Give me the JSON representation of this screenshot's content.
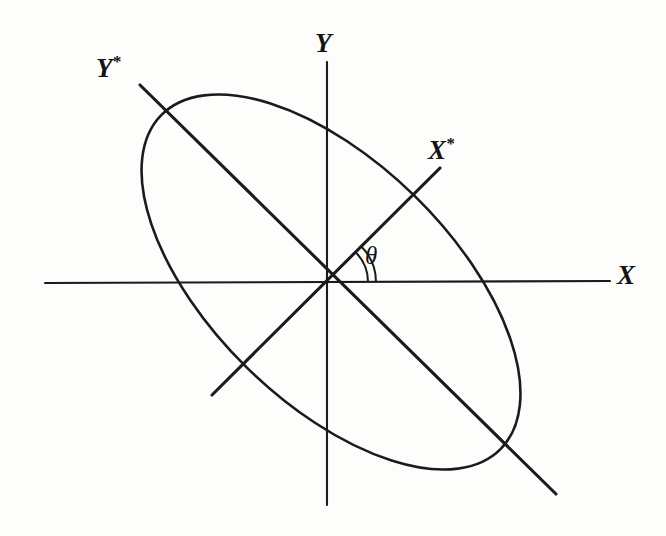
{
  "figure": {
    "background_color": "#fdfdfc",
    "ink_color": "#1b1b1b",
    "width": 666,
    "height": 536
  },
  "labels": {
    "x_axis": "X",
    "y_axis": "Y",
    "x_star_axis": "X",
    "x_star_superscript": "*",
    "y_star_axis": "Y",
    "y_star_superscript": "*",
    "angle": "θ"
  },
  "chart_data": {
    "type": "diagram",
    "origin": {
      "x": 326,
      "y": 282
    },
    "axes": [
      {
        "name": "X",
        "label": "X",
        "kind": "primary-horizontal",
        "from": {
          "x": 45,
          "y": 283
        },
        "to": {
          "x": 610,
          "y": 281
        },
        "angle_deg": 0,
        "label_position": {
          "x": 625,
          "y": 277
        }
      },
      {
        "name": "Y",
        "label": "Y",
        "kind": "primary-vertical",
        "from": {
          "x": 327,
          "y": 62
        },
        "to": {
          "x": 327,
          "y": 505
        },
        "angle_deg": 90,
        "label_position": {
          "x": 325,
          "y": 48
        }
      },
      {
        "name": "X*",
        "label": "X*",
        "kind": "rotated",
        "from": {
          "x": 212,
          "y": 395
        },
        "to": {
          "x": 440,
          "y": 168
        },
        "angle_deg": 44.8,
        "label_position": {
          "x": 445,
          "y": 152
        }
      },
      {
        "name": "Y*",
        "label": "Y*",
        "kind": "rotated",
        "from": {
          "x": 140,
          "y": 85
        },
        "to": {
          "x": 556,
          "y": 494
        },
        "angle_deg": -44.5,
        "label_position": {
          "x": 112,
          "y": 72
        }
      }
    ],
    "angle_marker": {
      "label": "θ",
      "vertex": {
        "x": 326,
        "y": 282
      },
      "from_axis": "X",
      "to_axis": "X*",
      "start_deg": 0,
      "end_deg": 44.8,
      "arc_radii": [
        42,
        50
      ],
      "label_position": {
        "x": 374,
        "y": 256
      }
    },
    "ellipse": {
      "center": {
        "x": 331,
        "y": 282
      },
      "semi_major": 238,
      "semi_minor": 120,
      "rotation_deg": 44.5,
      "major_axis_along": "Y*",
      "minor_axis_along": "X*",
      "extents": {
        "topmost": {
          "x": 186,
          "y": 82
        },
        "leftmost": {
          "x": 124,
          "y": 161
        },
        "rightmost": {
          "x": 540,
          "y": 400
        },
        "bottommost": {
          "x": 466,
          "y": 482
        }
      }
    },
    "xlabel": "X",
    "ylabel": "Y",
    "grid": false,
    "legend": null
  }
}
